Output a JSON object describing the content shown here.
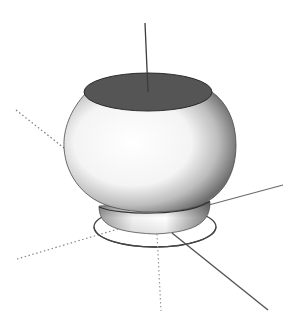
{
  "viewport": {
    "label": "3D modeling viewport",
    "background": "#ffffff"
  },
  "model": {
    "name": "round bowl / pot with foot",
    "opening_color": "#555555",
    "body_highlight": "#ffffff",
    "body_shadow": "#6e6e6e",
    "outline_color": "#333333"
  },
  "axes": {
    "solid_color": "#555555",
    "dotted_color": "#777777",
    "items": [
      {
        "name": "vertical-axis",
        "style": "solid"
      },
      {
        "name": "red-axis",
        "style": "solid"
      },
      {
        "name": "green-axis",
        "style": "solid"
      },
      {
        "name": "red-axis-negative",
        "style": "dotted"
      },
      {
        "name": "green-axis-negative",
        "style": "dotted"
      },
      {
        "name": "vertical-axis-negative",
        "style": "dotted"
      }
    ]
  },
  "guide": {
    "name": "base circle",
    "color": "#444444"
  }
}
